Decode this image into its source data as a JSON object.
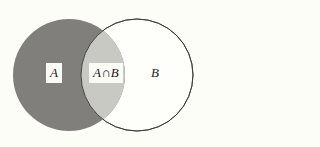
{
  "figure": {
    "type": "venn-diagram",
    "width": 206,
    "height": 147,
    "background_color": "#fdfdf8"
  },
  "colors": {
    "background": "#fdfdf8",
    "set_a_fill": "#807f7b",
    "set_b_fill": "#fefefa",
    "intersection_fill": "#c9c9c4",
    "circle_stroke": "#3a3a38",
    "label_text": "#1a1a1a",
    "label_box_fill": "#fbfbf6"
  },
  "circles": [
    {
      "name": "set-a",
      "label": "A",
      "cx": 69,
      "cy": 75,
      "r": 56,
      "fill": "#807f7b",
      "stroke": "none"
    },
    {
      "name": "set-b",
      "label": "B",
      "cx": 137,
      "cy": 75,
      "r": 56,
      "fill": "#fefefa",
      "stroke": "#3a3a38"
    }
  ],
  "labels": {
    "set_a": "A",
    "intersection": "A∩B",
    "set_b": "B"
  },
  "regions": [
    {
      "name": "a-only",
      "label": "A",
      "shading": "dark-gray"
    },
    {
      "name": "intersection",
      "label": "A∩B",
      "shading": "light-gray"
    },
    {
      "name": "b-only",
      "label": "B",
      "shading": "none"
    }
  ]
}
